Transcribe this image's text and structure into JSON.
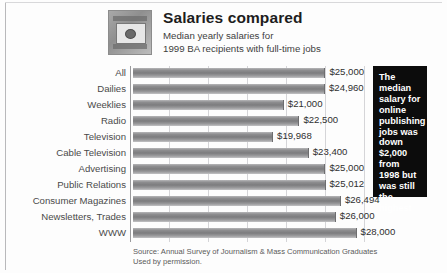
{
  "header": {
    "title": "Salaries compared",
    "subtitle_line1": "Median yearly salaries for",
    "subtitle_line2": "1999 BA recipients with full-time jobs",
    "thumbnail_alt": "camera-thumbnail"
  },
  "callout": {
    "text": "The median salary for online publishing jobs was down $2,000 from 1998 but was still the highest"
  },
  "source": {
    "line1": "Source: Annual Survey of Journalism & Mass Communication Graduates",
    "line2": "Used by permission."
  },
  "colors": {
    "bar": "#8e8e90",
    "callout_background": "#0c0c0c",
    "callout_text": "#ffffff",
    "gridline": "#d5d5d8",
    "axis": "#9a9a9c"
  },
  "chart_data": {
    "type": "bar",
    "orientation": "horizontal",
    "title": "Salaries compared",
    "subtitle": "Median yearly salaries for 1999 BA recipients with full-time jobs",
    "xlabel": "",
    "ylabel": "",
    "grid": true,
    "legend": "none",
    "xlim": [
      6500,
      29000
    ],
    "axis_truncated": true,
    "value_prefix": "$",
    "categories": [
      "All",
      "Dailies",
      "Weeklies",
      "Radio",
      "Television",
      "Cable Television",
      "Advertising",
      "Public Relations",
      "Consumer Magazines",
      "Newsletters,  Trades",
      "WWW"
    ],
    "values": [
      25000,
      24960,
      21000,
      22500,
      19968,
      23400,
      25000,
      25012,
      26494,
      26000,
      28000
    ],
    "value_labels": [
      "$25,000",
      "$24,960",
      "$21,000",
      "$22,500",
      "$19,968",
      "$23,400",
      "$25,000",
      "$25,012",
      "$26,494",
      "$26,000",
      "$28,000"
    ],
    "gridline_values": [
      10000,
      13750,
      17500,
      21250,
      25000,
      28750
    ]
  }
}
